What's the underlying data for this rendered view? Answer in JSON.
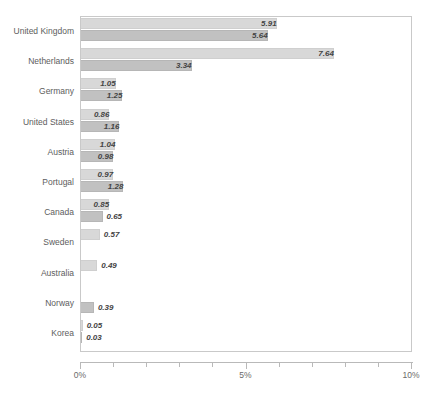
{
  "chart_data": {
    "type": "bar",
    "orientation": "horizontal",
    "title": "",
    "subtitle": "",
    "xlabel": "",
    "ylabel": "",
    "xlim": [
      0,
      10
    ],
    "xunit": "%",
    "grid": false,
    "legend": "none",
    "axis": {
      "tick_labels": [
        "0%",
        "5%",
        "10%"
      ],
      "tick_values": [
        0,
        5,
        10
      ],
      "minor_tick_values": [
        0,
        1,
        2,
        3,
        4,
        5,
        6,
        7,
        8,
        9,
        10
      ]
    },
    "categories": [
      "United Kingdom",
      "Netherlands",
      "Germany",
      "United States",
      "Austria",
      "Portugal",
      "Canada",
      "Sweden",
      "Australia",
      "Norway",
      "Korea"
    ],
    "series": [
      {
        "name": "series-1",
        "color": "#d8d8d8",
        "values": [
          5.91,
          7.64,
          1.05,
          0.86,
          1.04,
          0.97,
          0.85,
          0.57,
          0.49,
          null,
          0.05
        ],
        "labels": [
          "5.91",
          "7.64",
          "1.05",
          "0.86",
          "1.04",
          "0.97",
          "0.85",
          "0.57",
          "0.49",
          "",
          "0.05"
        ]
      },
      {
        "name": "series-2",
        "color": "#c1c1c1",
        "values": [
          5.64,
          3.34,
          1.25,
          1.16,
          0.98,
          1.28,
          0.65,
          null,
          null,
          0.39,
          0.03
        ],
        "labels": [
          "5.64",
          "3.34",
          "1.25",
          "1.16",
          "0.98",
          "1.28",
          "0.65",
          "",
          "",
          "0.39",
          "0.03"
        ]
      }
    ]
  },
  "colors": {
    "series_1": "#d8d8d8",
    "series_2": "#c1c1c1",
    "frame": "#c9c9c9",
    "axis": "#b9b9b9",
    "category_text": "#5d5d5d",
    "value_text": "#444444",
    "tick_text": "#6a6a6a",
    "background": "#ffffff"
  }
}
